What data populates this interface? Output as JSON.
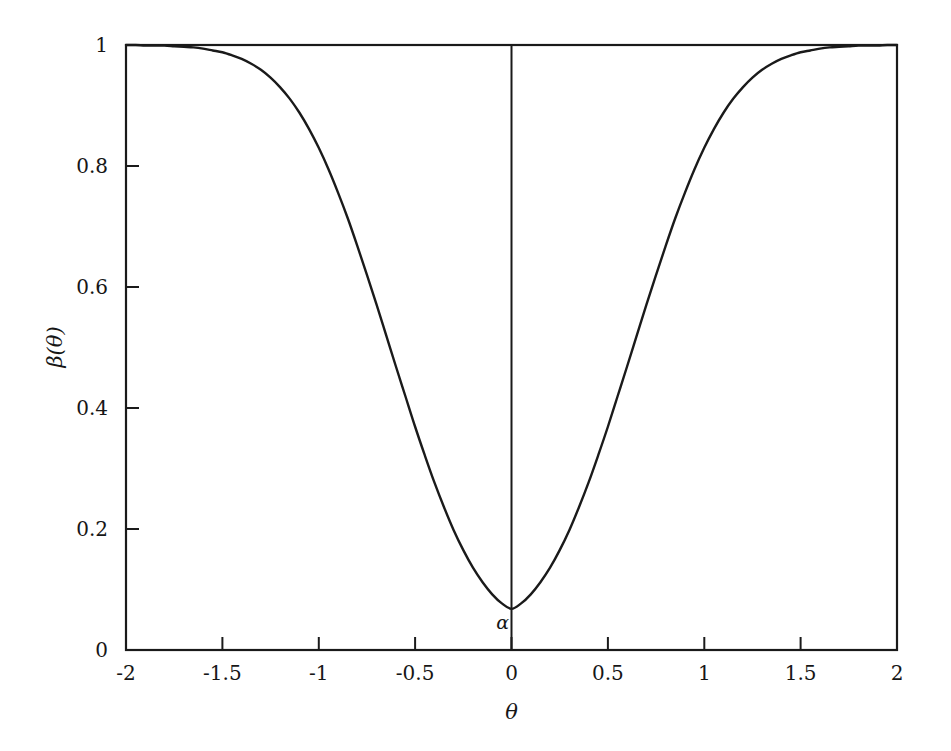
{
  "chart_data": {
    "type": "line",
    "title": "",
    "subtitle": "",
    "xlabel": "θ",
    "ylabel": "β(θ)",
    "xlim": [
      -2,
      2
    ],
    "ylim": [
      0,
      1
    ],
    "grid": false,
    "legend": null,
    "legend_position": "none",
    "line_color": "#1a1a1a",
    "axis_color": "#1a1a1a",
    "background_color": "#ffffff",
    "xticks": [
      -2,
      -1.5,
      -1,
      -0.5,
      0,
      0.5,
      1,
      1.5,
      2
    ],
    "xtick_labels": [
      "-2",
      "-1.5",
      "-1",
      "-0.5",
      "0",
      "0.5",
      "1",
      "1.5",
      "2"
    ],
    "yticks": [
      0,
      0.2,
      0.4,
      0.6,
      0.8,
      1
    ],
    "ytick_labels": [
      "0",
      "0.2",
      "0.4",
      "0.6",
      "0.8",
      "1"
    ],
    "annotations": [
      {
        "text": "α",
        "x": 0,
        "y": 0.05,
        "description": "significance-level marker at the minimum of the power function"
      }
    ],
    "reference_lines": [
      {
        "orientation": "vertical",
        "x": 0,
        "ymin": 0,
        "ymax": 1,
        "color": "#1a1a1a"
      }
    ],
    "series": [
      {
        "name": "β(θ)",
        "x": [
          -2,
          -1.95,
          -1.9,
          -1.85,
          -1.8,
          -1.75,
          -1.7,
          -1.65,
          -1.6,
          -1.55,
          -1.5,
          -1.45,
          -1.4,
          -1.35,
          -1.3,
          -1.25,
          -1.2,
          -1.15,
          -1.1,
          -1.05,
          -1,
          -0.95,
          -0.9,
          -0.85,
          -0.8,
          -0.75,
          -0.7,
          -0.65,
          -0.6,
          -0.55,
          -0.5,
          -0.45,
          -0.4,
          -0.35,
          -0.3,
          -0.25,
          -0.2,
          -0.15,
          -0.1,
          -0.05,
          0,
          0.05,
          0.1,
          0.15,
          0.2,
          0.25,
          0.3,
          0.35,
          0.4,
          0.45,
          0.5,
          0.55,
          0.6,
          0.65,
          0.7,
          0.75,
          0.8,
          0.85,
          0.9,
          0.95,
          1,
          1.05,
          1.1,
          1.15,
          1.2,
          1.25,
          1.3,
          1.35,
          1.4,
          1.45,
          1.5,
          1.55,
          1.6,
          1.65,
          1.7,
          1.75,
          1.8,
          1.85,
          1.9,
          1.95,
          2
        ],
        "y": [
          1,
          1,
          0.999,
          0.999,
          0.999,
          0.998,
          0.997,
          0.996,
          0.994,
          0.991,
          0.988,
          0.983,
          0.977,
          0.969,
          0.959,
          0.946,
          0.93,
          0.911,
          0.888,
          0.861,
          0.83,
          0.795,
          0.756,
          0.714,
          0.668,
          0.62,
          0.571,
          0.52,
          0.469,
          0.419,
          0.369,
          0.322,
          0.277,
          0.236,
          0.198,
          0.165,
          0.136,
          0.112,
          0.092,
          0.077,
          0.068,
          0.077,
          0.092,
          0.112,
          0.136,
          0.165,
          0.198,
          0.236,
          0.277,
          0.322,
          0.369,
          0.419,
          0.469,
          0.52,
          0.571,
          0.62,
          0.668,
          0.714,
          0.756,
          0.795,
          0.83,
          0.861,
          0.888,
          0.911,
          0.93,
          0.946,
          0.959,
          0.969,
          0.977,
          0.983,
          0.988,
          0.991,
          0.994,
          0.996,
          0.997,
          0.998,
          0.999,
          0.999,
          0.999,
          1,
          1
        ]
      }
    ]
  },
  "axes": {
    "y_title": "β(θ)",
    "x_title": "θ",
    "y_tick_0": "0",
    "y_tick_1": "0.2",
    "y_tick_2": "0.4",
    "y_tick_3": "0.6",
    "y_tick_4": "0.8",
    "y_tick_5": "1",
    "x_tick_0": "-2",
    "x_tick_1": "-1.5",
    "x_tick_2": "-1",
    "x_tick_3": "-0.5",
    "x_tick_4": "0",
    "x_tick_5": "0.5",
    "x_tick_6": "1",
    "x_tick_7": "1.5",
    "x_tick_8": "2"
  },
  "annotation": {
    "alpha_label": "α"
  }
}
